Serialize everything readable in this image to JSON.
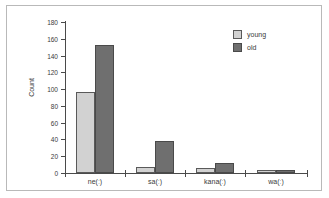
{
  "chart_data": {
    "type": "bar",
    "title": "",
    "subtitle": "",
    "xlabel": "",
    "ylabel": "Count",
    "categories": [
      "ne(ː)",
      "sa(ː)",
      "kana(ː)",
      "wa(ː)"
    ],
    "series": [
      {
        "name": "young",
        "color": "#d2d2d2",
        "values": [
          96,
          7,
          6,
          3
        ]
      },
      {
        "name": "old",
        "color": "#6f6f6f",
        "values": [
          153,
          38,
          12,
          3
        ]
      }
    ],
    "ylim": [
      0,
      180
    ],
    "ytick_step": 20,
    "yticks": [
      0,
      20,
      40,
      60,
      80,
      100,
      120,
      140,
      160,
      180
    ],
    "ytick_labels": [
      "0",
      "20",
      "40",
      "60",
      "80",
      "100",
      "120",
      "140",
      "160",
      "180"
    ],
    "grid": false,
    "legend_position": "top-right",
    "legend_entries": [
      "young",
      "old"
    ],
    "annotations": [],
    "frame_color": "#b9b9b9",
    "axis_color": "#4a4a4a",
    "background": "#ffffff"
  }
}
